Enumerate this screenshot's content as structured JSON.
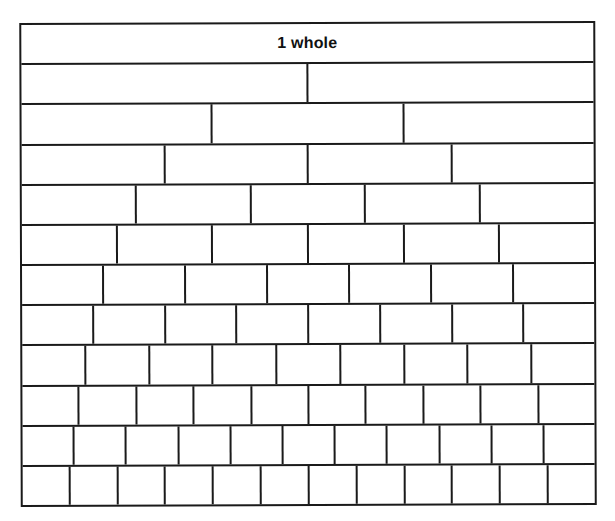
{
  "figure": {
    "name": "fraction-wall",
    "title_cell_label": "1 whole",
    "row_count": 12,
    "border_color": "#1a1a1a",
    "background_color": "#ffffff"
  },
  "chart_data": {
    "type": "bar",
    "title": "1 whole",
    "xlabel": "",
    "ylabel": "",
    "categories": [
      "1 whole",
      "halves",
      "thirds",
      "fourths",
      "fifths",
      "sixths",
      "sevenths",
      "eighths",
      "ninths",
      "tenths",
      "elevenths",
      "twelfths"
    ],
    "values": [
      1,
      2,
      3,
      4,
      5,
      6,
      7,
      8,
      9,
      10,
      11,
      12
    ],
    "grid": false,
    "legend": "none"
  },
  "rows": [
    {
      "name": "row-1-whole",
      "parts": 1,
      "labels": [
        "1 whole"
      ]
    },
    {
      "name": "row-halves",
      "parts": 2,
      "labels": [
        "",
        ""
      ]
    },
    {
      "name": "row-thirds",
      "parts": 3,
      "labels": [
        "",
        "",
        ""
      ]
    },
    {
      "name": "row-fourths",
      "parts": 4,
      "labels": [
        "",
        "",
        "",
        ""
      ]
    },
    {
      "name": "row-fifths",
      "parts": 5,
      "labels": [
        "",
        "",
        "",
        "",
        ""
      ]
    },
    {
      "name": "row-sixths",
      "parts": 6,
      "labels": [
        "",
        "",
        "",
        "",
        "",
        ""
      ]
    },
    {
      "name": "row-sevenths",
      "parts": 7,
      "labels": [
        "",
        "",
        "",
        "",
        "",
        "",
        ""
      ]
    },
    {
      "name": "row-eighths",
      "parts": 8,
      "labels": [
        "",
        "",
        "",
        "",
        "",
        "",
        "",
        ""
      ]
    },
    {
      "name": "row-ninths",
      "parts": 9,
      "labels": [
        "",
        "",
        "",
        "",
        "",
        "",
        "",
        "",
        ""
      ]
    },
    {
      "name": "row-tenths",
      "parts": 10,
      "labels": [
        "",
        "",
        "",
        "",
        "",
        "",
        "",
        "",
        "",
        ""
      ]
    },
    {
      "name": "row-elevenths",
      "parts": 11,
      "labels": [
        "",
        "",
        "",
        "",
        "",
        "",
        "",
        "",
        "",
        "",
        ""
      ]
    },
    {
      "name": "row-twelfths",
      "parts": 12,
      "labels": [
        "",
        "",
        "",
        "",
        "",
        "",
        "",
        "",
        "",
        "",
        "",
        ""
      ]
    }
  ]
}
